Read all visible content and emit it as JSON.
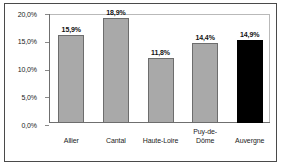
{
  "chart_data": {
    "type": "bar",
    "title": "",
    "subtitle": "",
    "xlabel": "",
    "ylabel": "",
    "categories": [
      "Allier",
      "Cantal",
      "Haute-Loire",
      "Puy-de-Dôme",
      "Auvergne"
    ],
    "category_lines": [
      [
        "Allier"
      ],
      [
        "Cantal"
      ],
      [
        "Haute-Loire"
      ],
      [
        "Puy-de-",
        "Dôme"
      ],
      [
        "Auvergne"
      ]
    ],
    "values": [
      15.9,
      18.9,
      11.8,
      14.4,
      14.9
    ],
    "value_labels": [
      "15,9%",
      "18,9%",
      "11,8%",
      "14,4%",
      "14,9%"
    ],
    "bar_colors": [
      "#a9a9a9",
      "#a9a9a9",
      "#a9a9a9",
      "#a9a9a9",
      "#000000"
    ],
    "ylim": [
      0,
      20
    ],
    "yticks": [
      0,
      5,
      10,
      15,
      20
    ],
    "ytick_labels": [
      "0,0%",
      "5,0%",
      "10,0%",
      "15,0%",
      "20,0%"
    ],
    "grid": false,
    "legend": false,
    "legend_position": "none",
    "decimal_separator": ",",
    "highlight_category": "Auvergne"
  },
  "colors": {
    "bar_gray": "#a9a9a9",
    "bar_gray_edge": "#6d6d6d",
    "bar_black": "#000000",
    "frame": "#4a4a4a",
    "plot_border": "#b9b9b9",
    "axis": "#6f6f6f",
    "text": "#1b1b1b",
    "background": "#ffffff"
  }
}
